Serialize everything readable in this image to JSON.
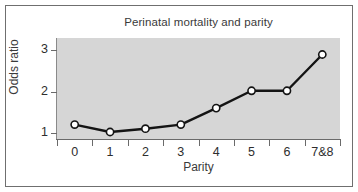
{
  "chart_data": {
    "type": "line",
    "title": "Perinatal mortality and parity",
    "xlabel": "Parity",
    "ylabel": "Odds ratio",
    "categories": [
      "0",
      "1",
      "2",
      "3",
      "4",
      "5",
      "6",
      "7&8"
    ],
    "values": [
      1.2,
      1.02,
      1.1,
      1.2,
      1.6,
      2.02,
      2.02,
      2.9
    ],
    "ylim": [
      0.85,
      3.3
    ],
    "yticks": [
      1,
      2,
      3
    ],
    "ytick_labels": [
      "1",
      "2",
      "3"
    ],
    "grid": false,
    "legend": "none",
    "marker": "open-circle",
    "line_color": "#141414",
    "marker_fill": "#ffffff",
    "plot_background": "#d6d6d6",
    "figure_background": "#ffffff",
    "frame_color": "#6f6f6f"
  }
}
